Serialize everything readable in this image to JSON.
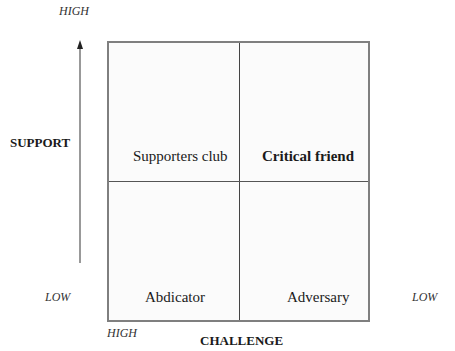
{
  "axes": {
    "support": {
      "label": "SUPPORT",
      "high": "HIGH",
      "low": "LOW"
    },
    "challenge": {
      "label": "CHALLENGE",
      "high": "HIGH",
      "low": "LOW"
    }
  },
  "quadrants": {
    "top_left": "Supporters club",
    "top_right": "Critical friend",
    "bottom_left": "Abdicator",
    "bottom_right": "Adversary"
  }
}
